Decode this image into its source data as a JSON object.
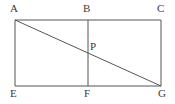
{
  "figure": {
    "type": "geometry-diagram",
    "background_color": "#ffffff",
    "stroke_color": "#555555",
    "label_color": "#3a3a3a",
    "stroke_width": 1,
    "canvas": {
      "width": 175,
      "height": 104
    },
    "points": {
      "A": {
        "label": "A",
        "x": 15,
        "y": 20,
        "label_x": 10,
        "label_y": 3
      },
      "B": {
        "label": "B",
        "x": 88,
        "y": 20,
        "label_x": 83,
        "label_y": 3
      },
      "C": {
        "label": "C",
        "x": 161,
        "y": 20,
        "label_x": 157,
        "label_y": 3
      },
      "E": {
        "label": "E",
        "x": 15,
        "y": 86,
        "label_x": 10,
        "label_y": 88
      },
      "F": {
        "label": "F",
        "x": 88,
        "y": 86,
        "label_x": 84,
        "label_y": 88
      },
      "G": {
        "label": "G",
        "x": 161,
        "y": 86,
        "label_x": 158,
        "label_y": 88
      },
      "P": {
        "label": "P",
        "x": 88,
        "y": 53,
        "label_x": 90,
        "label_y": 41
      }
    },
    "segments": [
      {
        "name": "side-AC-top",
        "from": "A",
        "to": "C"
      },
      {
        "name": "side-CG-right",
        "from": "C",
        "to": "G"
      },
      {
        "name": "side-GE-bottom",
        "from": "G",
        "to": "E"
      },
      {
        "name": "side-EA-left",
        "from": "E",
        "to": "A"
      },
      {
        "name": "segment-BF-vertical",
        "from": "B",
        "to": "F"
      },
      {
        "name": "diagonal-AG",
        "from": "A",
        "to": "G"
      }
    ]
  }
}
